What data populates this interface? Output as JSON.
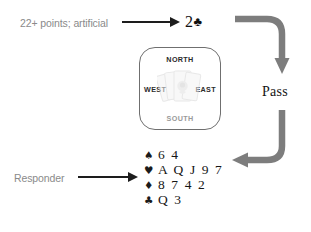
{
  "diagram": {
    "colors": {
      "annotation_text": "#8a8a8a",
      "arrow_black": "#1d1d1d",
      "arrow_gray": "#7d7d7d",
      "box_border": "#6f6f6f",
      "compass_dark": "#2b2b2b",
      "compass_light": "#9a9a9a",
      "card_text": "#151515"
    }
  },
  "annotations": {
    "opening_bid_note": "22+ points; artificial",
    "responder_note": "Responder"
  },
  "bid": {
    "level": "2",
    "suit_symbol": "♣",
    "full": "2♣"
  },
  "compass": {
    "north": "NORTH",
    "south": "SOUTH",
    "west": "WEST",
    "east": "EAST",
    "center_icon": "fanned-playing-cards"
  },
  "pass": {
    "label": "Pass"
  },
  "hand": {
    "rows": [
      {
        "suit_name": "spade",
        "suit_symbol": "♠",
        "cards": "6 4"
      },
      {
        "suit_name": "heart",
        "suit_symbol": "♥",
        "cards": "A Q J 9 7"
      },
      {
        "suit_name": "diamond",
        "suit_symbol": "♦",
        "cards": "8 7 4 2"
      },
      {
        "suit_name": "club",
        "suit_symbol": "♣",
        "cards": "Q 3"
      }
    ]
  },
  "flow_arrows": [
    {
      "name": "bid-to-pass-arrow",
      "direction": "down",
      "description": "curves right from the 2 Clubs bid then points down toward Pass"
    },
    {
      "name": "pass-to-responder-arrow",
      "direction": "left",
      "description": "curves down from Pass then points left toward the responder hand"
    }
  ]
}
